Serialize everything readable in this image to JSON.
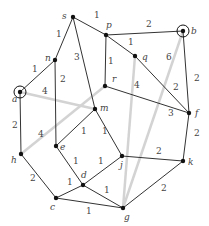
{
  "vertices": [
    {
      "id": "s",
      "label": "s",
      "x": 73,
      "y": 17,
      "lx": 62,
      "ly": 19,
      "marked": false
    },
    {
      "id": "p",
      "label": "p",
      "x": 106,
      "y": 35,
      "lx": 106,
      "ly": 28,
      "marked": false
    },
    {
      "id": "b",
      "label": "b",
      "x": 183,
      "y": 31,
      "lx": 191,
      "ly": 34,
      "marked": true
    },
    {
      "id": "n",
      "label": "n",
      "x": 55,
      "y": 60,
      "lx": 45,
      "ly": 61,
      "marked": false
    },
    {
      "id": "q",
      "label": "q",
      "x": 135,
      "y": 56,
      "lx": 142,
      "ly": 60,
      "marked": false
    },
    {
      "id": "a",
      "label": "a",
      "x": 20,
      "y": 92,
      "lx": 12,
      "ly": 102,
      "marked": true
    },
    {
      "id": "r",
      "label": "r",
      "x": 105,
      "y": 86,
      "lx": 112,
      "ly": 82,
      "marked": false
    },
    {
      "id": "m",
      "label": "m",
      "x": 95,
      "y": 109,
      "lx": 100,
      "ly": 111,
      "marked": false
    },
    {
      "id": "f",
      "label": "f",
      "x": 189,
      "y": 113,
      "lx": 195,
      "ly": 116,
      "marked": false
    },
    {
      "id": "e",
      "label": "e",
      "x": 56,
      "y": 146,
      "lx": 60,
      "ly": 150,
      "marked": false
    },
    {
      "id": "h",
      "label": "h",
      "x": 21,
      "y": 154,
      "lx": 11,
      "ly": 163,
      "marked": false
    },
    {
      "id": "j",
      "label": "j",
      "x": 122,
      "y": 156,
      "lx": 120,
      "ly": 168,
      "marked": false
    },
    {
      "id": "k",
      "label": "k",
      "x": 183,
      "y": 161,
      "lx": 188,
      "ly": 165,
      "marked": false
    },
    {
      "id": "d",
      "label": "d",
      "x": 83,
      "y": 185,
      "lx": 81,
      "ly": 178,
      "marked": false
    },
    {
      "id": "c",
      "label": "c",
      "x": 56,
      "y": 198,
      "lx": 50,
      "ly": 210,
      "marked": false
    },
    {
      "id": "g",
      "label": "g",
      "x": 123,
      "y": 208,
      "lx": 124,
      "ly": 220,
      "marked": false
    }
  ],
  "edges": [
    {
      "from": "s",
      "to": "p",
      "weight": "1",
      "style": "dark",
      "lx": 94,
      "ly": 18
    },
    {
      "from": "s",
      "to": "n",
      "weight": "1",
      "style": "dark",
      "lx": 56,
      "ly": 37
    },
    {
      "from": "s",
      "to": "m",
      "weight": "3",
      "style": "dark",
      "lx": 74,
      "ly": 60
    },
    {
      "from": "p",
      "to": "b",
      "weight": "2",
      "style": "dark",
      "lx": 146,
      "ly": 27
    },
    {
      "from": "p",
      "to": "q",
      "weight": "1",
      "style": "dark",
      "lx": 128,
      "ly": 45
    },
    {
      "from": "p",
      "to": "r",
      "weight": "1",
      "style": "dark",
      "lx": 108,
      "ly": 64
    },
    {
      "from": "q",
      "to": "f",
      "weight": "2",
      "style": "dark",
      "lx": 173,
      "ly": 90
    },
    {
      "from": "b",
      "to": "f",
      "weight": "2",
      "style": "dark",
      "lx": 194,
      "ly": 81
    },
    {
      "from": "r",
      "to": "f",
      "weight": "3",
      "style": "dark",
      "lx": 168,
      "ly": 116
    },
    {
      "from": "n",
      "to": "a",
      "weight": "1",
      "style": "dark",
      "lx": 32,
      "ly": 72
    },
    {
      "from": "n",
      "to": "e",
      "weight": "2",
      "style": "dark",
      "lx": 60,
      "ly": 82
    },
    {
      "from": "a",
      "to": "h",
      "weight": "2",
      "style": "dark",
      "lx": 12,
      "ly": 128
    },
    {
      "from": "m",
      "to": "e",
      "weight": "1",
      "style": "dark",
      "lx": 81,
      "ly": 134
    },
    {
      "from": "m",
      "to": "j",
      "weight": "1",
      "style": "dark",
      "lx": 102,
      "ly": 134
    },
    {
      "from": "f",
      "to": "k",
      "weight": "2",
      "style": "dark",
      "lx": 194,
      "ly": 136
    },
    {
      "from": "e",
      "to": "d",
      "weight": "1",
      "style": "dark",
      "lx": 73,
      "ly": 164
    },
    {
      "from": "h",
      "to": "c",
      "weight": "2",
      "style": "dark",
      "lx": 30,
      "ly": 181
    },
    {
      "from": "j",
      "to": "k",
      "weight": "2",
      "style": "dark",
      "lx": 156,
      "ly": 154
    },
    {
      "from": "j",
      "to": "d",
      "weight": "1",
      "style": "dark",
      "lx": 98,
      "ly": 164
    },
    {
      "from": "d",
      "to": "c",
      "weight": "1",
      "style": "dark",
      "lx": 67,
      "ly": 185
    },
    {
      "from": "d",
      "to": "g",
      "weight": "1",
      "style": "dark",
      "lx": 104,
      "ly": 193
    },
    {
      "from": "c",
      "to": "g",
      "weight": "1",
      "style": "dark",
      "lx": 86,
      "ly": 214
    },
    {
      "from": "k",
      "to": "g",
      "weight": "2",
      "style": "dark",
      "lx": 161,
      "ly": 191
    },
    {
      "from": "a",
      "to": "m",
      "weight": "4",
      "style": "gray",
      "lx": 42,
      "ly": 94
    },
    {
      "from": "h",
      "to": "r",
      "weight": "4",
      "style": "gray",
      "lx": 38,
      "ly": 137
    },
    {
      "from": "q",
      "to": "g",
      "weight": "4",
      "style": "gray",
      "lx": 134,
      "ly": 88
    },
    {
      "from": "b",
      "to": "g",
      "weight": "6",
      "style": "gray",
      "lx": 166,
      "ly": 60
    }
  ]
}
